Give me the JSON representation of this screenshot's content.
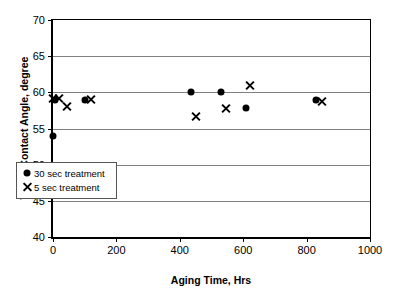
{
  "chart_data": {
    "type": "scatter",
    "title": "",
    "xlabel": "Aging Time, Hrs",
    "ylabel": "Water Contact Angle, degree",
    "xlim": [
      0,
      1000
    ],
    "ylim": [
      40,
      70
    ],
    "xticks": [
      0,
      200,
      400,
      600,
      800,
      1000
    ],
    "yticks": [
      40,
      45,
      50,
      55,
      60,
      65,
      70
    ],
    "xtick_labels": [
      "0",
      "200",
      "400",
      "600",
      "800",
      "1000"
    ],
    "ytick_labels": [
      "40",
      "45",
      "50",
      "55",
      "60",
      "65",
      "70"
    ],
    "grid": "horizontal",
    "legend_position": "lower left",
    "series": [
      {
        "name": "30 sec treatment",
        "marker": "filled-circle",
        "color": "#000000",
        "points": [
          {
            "x": 0,
            "y": 54.0
          },
          {
            "x": 5,
            "y": 59.0
          },
          {
            "x": 100,
            "y": 59.0
          },
          {
            "x": 435,
            "y": 60.0
          },
          {
            "x": 530,
            "y": 60.0
          },
          {
            "x": 610,
            "y": 57.8
          },
          {
            "x": 830,
            "y": 58.9
          }
        ]
      },
      {
        "name": "5 sec treatment",
        "marker": "cross",
        "color": "#000000",
        "points": [
          {
            "x": 0,
            "y": 59.1
          },
          {
            "x": 20,
            "y": 59.1
          },
          {
            "x": 45,
            "y": 58.0
          },
          {
            "x": 120,
            "y": 59.0
          },
          {
            "x": 450,
            "y": 56.7
          },
          {
            "x": 545,
            "y": 57.7
          },
          {
            "x": 620,
            "y": 61.0
          },
          {
            "x": 850,
            "y": 58.8
          }
        ]
      }
    ]
  },
  "legend": {
    "items": [
      {
        "label": "30 sec treatment",
        "marker": "filled-circle"
      },
      {
        "label": "5 sec treatment",
        "marker": "cross"
      }
    ]
  }
}
